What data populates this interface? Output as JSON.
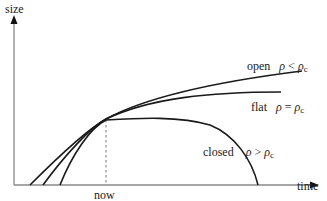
{
  "diagram": {
    "type": "line",
    "title": "",
    "axes": {
      "y_label": "size",
      "x_label": "time"
    },
    "marker": {
      "label": "now",
      "style": "dashed-vertical"
    },
    "curves": [
      {
        "name": "open",
        "label": "open",
        "condition_lhs": "ρ",
        "condition_op": "<",
        "condition_rhs": "ρ",
        "condition_sub": "c",
        "shape": "grows without bound"
      },
      {
        "name": "flat",
        "label": "flat",
        "condition_lhs": "ρ",
        "condition_op": "=",
        "condition_rhs": "ρ",
        "condition_sub": "c",
        "shape": "grows, slowing"
      },
      {
        "name": "closed",
        "label": "closed",
        "condition_lhs": "ρ",
        "condition_op": ">",
        "condition_rhs": "ρ",
        "condition_sub": "c",
        "shape": "expands then recollapses"
      }
    ],
    "colors": {
      "curve": "#1a1a1a",
      "axis": "#888888",
      "text": "#222222"
    }
  }
}
